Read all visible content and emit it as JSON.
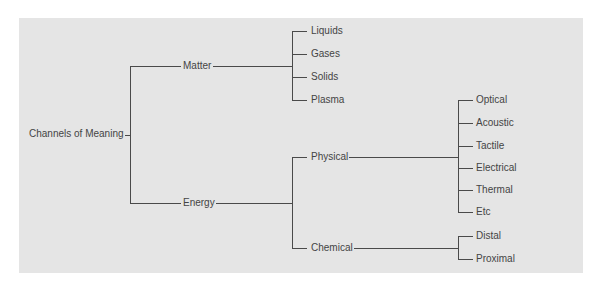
{
  "diagram": {
    "type": "tree",
    "background": "#e5e5e5",
    "line_color": "#4a4a4a",
    "text_color": "#444444",
    "root": {
      "label": "Channels of Meaning",
      "children": [
        {
          "label": "Matter",
          "children": [
            {
              "label": "Liquids"
            },
            {
              "label": "Gases"
            },
            {
              "label": "Solids"
            },
            {
              "label": "Plasma"
            }
          ]
        },
        {
          "label": "Energy",
          "children": [
            {
              "label": "Physical",
              "children": [
                {
                  "label": "Optical"
                },
                {
                  "label": "Acoustic"
                },
                {
                  "label": "Tactile"
                },
                {
                  "label": "Electrical"
                },
                {
                  "label": "Thermal"
                },
                {
                  "label": "Etc"
                }
              ]
            },
            {
              "label": "Chemical",
              "children": [
                {
                  "label": "Distal"
                },
                {
                  "label": "Proximal"
                }
              ]
            }
          ]
        }
      ]
    }
  }
}
